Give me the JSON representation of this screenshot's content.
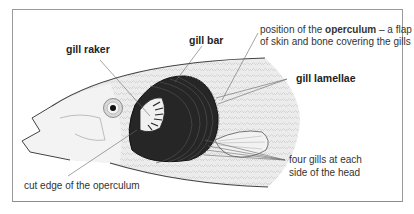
{
  "diagram": {
    "labels": {
      "gill_raker": "gill raker",
      "gill_bar": "gill bar",
      "operculum_pre": "position of the ",
      "operculum_bold": "operculum",
      "operculum_post": " – a flap",
      "operculum_line2": "of skin and bone covering the gills",
      "gill_lamellae": "gill lamellae",
      "four_gills_line1": "four gills at each",
      "four_gills_line2": "side of the head",
      "cut_edge": "cut edge of the operculum"
    },
    "colors": {
      "gill_dark": "#2a2a2a",
      "body_light": "#e9e9e9",
      "outline": "#444444",
      "leader_line": "#666666",
      "frame": "#9a9a9a"
    }
  }
}
